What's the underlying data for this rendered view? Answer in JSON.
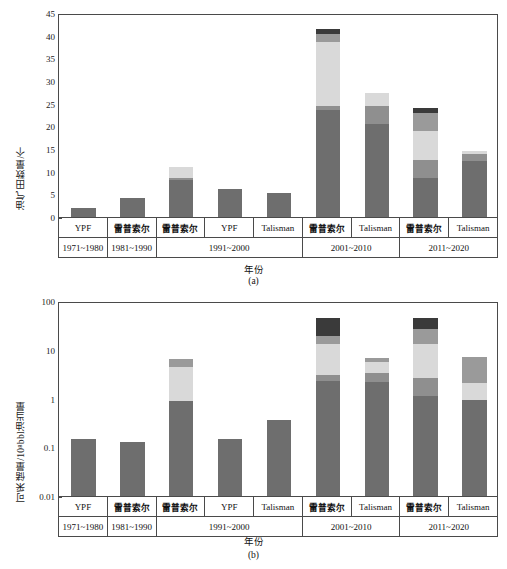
{
  "figure": {
    "background": "#ffffff",
    "axis_color": "#4a4a4a"
  },
  "palette": {
    "s1": "#6e6e6e",
    "s2": "#8f8f8f",
    "s3": "#bdbdbd",
    "s4": "#d9d9d9",
    "s5": "#9a9a9a",
    "s6": "#7a7a7a",
    "s7": "#3a3a3a"
  },
  "categories": [
    {
      "company": "YPF",
      "period": "1971~1980"
    },
    {
      "company": "雷普索尔",
      "period": "1981~1990"
    },
    {
      "company": "雷普索尔",
      "period": "1991~2000"
    },
    {
      "company": "YPF",
      "period": "1991~2000"
    },
    {
      "company": "Talisman",
      "period": "1991~2000"
    },
    {
      "company": "雷普索尔",
      "period": "2001~2010"
    },
    {
      "company": "Talisman",
      "period": "2001~2010"
    },
    {
      "company": "雷普索尔",
      "period": "2011~2020"
    },
    {
      "company": "Talisman",
      "period": "2011~2020"
    }
  ],
  "period_groups": [
    {
      "label": "1971~1980",
      "span": 1
    },
    {
      "label": "1981~1990",
      "span": 1
    },
    {
      "label": "1991~2000",
      "span": 3
    },
    {
      "label": "2001~2010",
      "span": 2
    },
    {
      "label": "2011~2020",
      "span": 2
    }
  ],
  "panel_a": {
    "caption": "(a)",
    "ylabel": "油气田数量/个",
    "xlabel": "年份",
    "yticks": [
      0,
      5,
      10,
      15,
      20,
      25,
      30,
      35,
      40,
      45
    ]
  },
  "panel_b": {
    "caption": "(b)",
    "ylabel": "可采储量/10⁸bbl油当量",
    "xlabel": "年份",
    "yticks": [
      "0.01",
      "0.1",
      "1",
      "10",
      "100"
    ]
  },
  "chart_data": [
    {
      "type": "bar",
      "stacked": true,
      "panel": "(a)",
      "title": "",
      "xlabel": "年份",
      "ylabel": "油气田数量/个",
      "yscale": "linear",
      "ylim": [
        0,
        45
      ],
      "ytick_values": [
        0,
        5,
        10,
        15,
        20,
        25,
        30,
        35,
        40,
        45
      ],
      "grid": false,
      "legend": "none",
      "categories": [
        "YPF 1971~1980",
        "雷普索尔 1981~1990",
        "雷普索尔 1991~2000",
        "YPF 1991~2000",
        "Talisman 1991~2000",
        "雷普索尔 2001~2010",
        "Talisman 2001~2010",
        "雷普索尔 2011~2020",
        "Talisman 2011~2020"
      ],
      "series": [
        {
          "name": "segment-1",
          "color": "#6e6e6e",
          "values": [
            1.9,
            4.1,
            8.1,
            6.2,
            5.2,
            23.7,
            20.5,
            8.5,
            12.4
          ]
        },
        {
          "name": "segment-2",
          "color": "#8f8f8f",
          "values": [
            0,
            0,
            0.6,
            0,
            0,
            0.7,
            3.9,
            4.1,
            1.5
          ]
        },
        {
          "name": "segment-3",
          "color": "#d9d9d9",
          "values": [
            0,
            0,
            2.4,
            0,
            0,
            14.1,
            3.0,
            6.4,
            0.7
          ]
        },
        {
          "name": "segment-4",
          "color": "#9a9a9a",
          "values": [
            0,
            0,
            0,
            0,
            0,
            1.9,
            0,
            3.9,
            0
          ]
        },
        {
          "name": "segment-5",
          "color": "#3a3a3a",
          "values": [
            0,
            0,
            0,
            0,
            0,
            1.0,
            0,
            1.2,
            0
          ]
        }
      ],
      "totals": [
        1.9,
        4.1,
        11.1,
        6.2,
        5.2,
        41.4,
        27.4,
        24.1,
        14.6
      ]
    },
    {
      "type": "bar",
      "stacked": true,
      "panel": "(b)",
      "title": "",
      "xlabel": "年份",
      "ylabel": "可采储量/10⁸bbl油当量",
      "yscale": "log",
      "ylim": [
        0.01,
        100
      ],
      "ytick_values": [
        0.01,
        0.1,
        1,
        10,
        100
      ],
      "grid": false,
      "legend": "none",
      "categories": [
        "YPF 1971~1980",
        "雷普索尔 1981~1990",
        "雷普索尔 1991~2000",
        "YPF 1991~2000",
        "Talisman 1991~2000",
        "雷普索尔 2001~2010",
        "Talisman 2001~2010",
        "雷普索尔 2011~2020",
        "Talisman 2011~2020"
      ],
      "series": [
        {
          "name": "segment-1",
          "color": "#6e6e6e",
          "cumulative": [
            0.145,
            0.128,
            0.88,
            0.145,
            0.36,
            2.3,
            2.2,
            1.1,
            0.92
          ]
        },
        {
          "name": "segment-2",
          "color": "#8f8f8f",
          "cumulative": [
            0.145,
            0.128,
            0.88,
            0.145,
            0.36,
            3.0,
            3.4,
            2.6,
            0.92
          ]
        },
        {
          "name": "segment-3",
          "color": "#d9d9d9",
          "cumulative": [
            0.145,
            0.128,
            4.4,
            0.145,
            0.36,
            13.0,
            5.6,
            13.0,
            2.1
          ]
        },
        {
          "name": "segment-4",
          "color": "#9a9a9a",
          "cumulative": [
            0.145,
            0.128,
            6.4,
            0.145,
            0.36,
            19.0,
            6.9,
            27.0,
            7.0
          ]
        },
        {
          "name": "segment-5",
          "color": "#3a3a3a",
          "cumulative": [
            0.145,
            0.128,
            6.4,
            0.145,
            0.36,
            44.0,
            6.9,
            44.0,
            7.0
          ]
        }
      ],
      "totals": [
        0.145,
        0.128,
        6.4,
        0.145,
        0.36,
        44.0,
        6.9,
        44.0,
        7.0
      ]
    }
  ]
}
